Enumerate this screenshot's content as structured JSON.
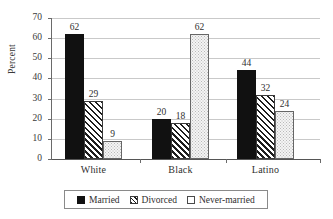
{
  "chart_data": {
    "type": "bar",
    "title": "",
    "subtitle": "",
    "xlabel": "",
    "ylabel": "Percent",
    "categories": [
      "White",
      "Black",
      "Latino"
    ],
    "series": [
      {
        "name": "Married",
        "values": [
          62,
          29,
          44
        ],
        "pattern": "solid-black"
      },
      {
        "name": "Divorced",
        "values": [
          29,
          18,
          32
        ],
        "pattern": "diagonal-hatch"
      },
      {
        "name": "Never-married",
        "values": [
          9,
          62,
          24
        ],
        "pattern": "light-dotted"
      }
    ],
    "grouped_values": {
      "White": {
        "Married": 62,
        "Divorced": 29,
        "Never-married": 9
      },
      "Black": {
        "Married": 20,
        "Divorced": 18,
        "Never-married": 62
      },
      "Latino": {
        "Married": 44,
        "Divorced": 32,
        "Never-married": 24
      }
    },
    "ylim": [
      0,
      70
    ],
    "ytick_step": 10,
    "ytick_labels": [
      "0",
      "10",
      "20",
      "30",
      "40",
      "50",
      "60",
      "70"
    ],
    "grid": "horizontal",
    "legend_position": "bottom",
    "data_labels": true,
    "bars": [
      {
        "category": "White",
        "series": "Married",
        "value": 62,
        "label": "62"
      },
      {
        "category": "White",
        "series": "Divorced",
        "value": 29,
        "label": "29"
      },
      {
        "category": "White",
        "series": "Never-married",
        "value": 9,
        "label": "9"
      },
      {
        "category": "Black",
        "series": "Married",
        "value": 20,
        "label": "20"
      },
      {
        "category": "Black",
        "series": "Divorced",
        "value": 18,
        "label": "18"
      },
      {
        "category": "Black",
        "series": "Never-married",
        "value": 62,
        "label": "62"
      },
      {
        "category": "Latino",
        "series": "Married",
        "value": 44,
        "label": "44"
      },
      {
        "category": "Latino",
        "series": "Divorced",
        "value": 32,
        "label": "32"
      },
      {
        "category": "Latino",
        "series": "Never-married",
        "value": 24,
        "label": "24"
      }
    ]
  },
  "axis": {
    "y_title": "Percent",
    "y_ticks": [
      "70",
      "60",
      "50",
      "40",
      "30",
      "20",
      "10",
      "0"
    ],
    "x_categories": [
      "White",
      "Black",
      "Latino"
    ]
  },
  "legend": {
    "items": [
      {
        "label": "Married",
        "swatch": "solid-black-square"
      },
      {
        "label": "Divorced",
        "swatch": "hatched-square"
      },
      {
        "label": "Never-married",
        "swatch": "empty-square"
      }
    ]
  },
  "colors": {
    "married": "#111111",
    "divorced_hatch": "#1d1d1d",
    "never_married_fill": "#f4f4f4",
    "gridline": "#c9c9c9",
    "axis": "#555555",
    "text": "#2f2f2f",
    "background": "#ffffff"
  }
}
